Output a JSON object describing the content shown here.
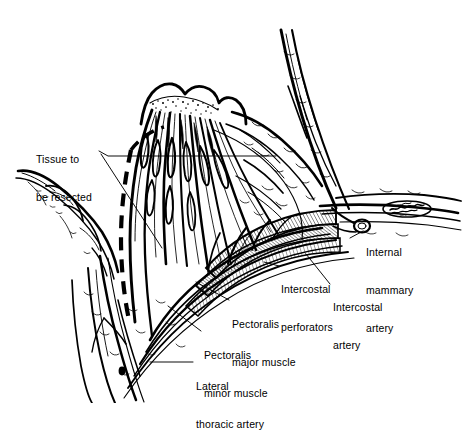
{
  "figure": {
    "style": "pen-and-ink medical line illustration",
    "background_color": "#ffffff",
    "ink_color": "#000000",
    "canvas": {
      "width": 462,
      "height": 403
    }
  },
  "labels": [
    {
      "id": "tissue-to-be-resected",
      "line1": "Tissue to",
      "line2": "be resected",
      "x": 36,
      "y": 128,
      "align": "left"
    },
    {
      "id": "internal-mammary-artery",
      "line1": "Internal",
      "line2": "mammary",
      "line3": "artery",
      "x": 366,
      "y": 228,
      "align": "left"
    },
    {
      "id": "intercostal-artery",
      "line1": "Intercostal",
      "line2": "artery",
      "x": 333,
      "y": 281,
      "align": "left"
    },
    {
      "id": "intercostal-perforators",
      "line1": "Intercostal",
      "line2": "perforators",
      "x": 281,
      "y": 262,
      "align": "left"
    },
    {
      "id": "pectoralis-major-muscle",
      "line1": "Pectoralis",
      "line2": "major muscle",
      "x": 232,
      "y": 296,
      "align": "left"
    },
    {
      "id": "pectoralis-minor-muscle",
      "line1": "Pectoralis",
      "line2": "minor muscle",
      "x": 204,
      "y": 327,
      "align": "left"
    },
    {
      "id": "lateral-thoracic-artery",
      "line1": "Lateral",
      "line2": "thoracic artery",
      "x": 196,
      "y": 358,
      "align": "left"
    }
  ],
  "annotations": {
    "resection_margin": "bold dashed curve through breast parenchyma",
    "dissection_plane": "thin arc across upper breast",
    "leader_lines": 7,
    "vessel_endpoint_marker": "filled dot at lateral thoracic artery"
  }
}
